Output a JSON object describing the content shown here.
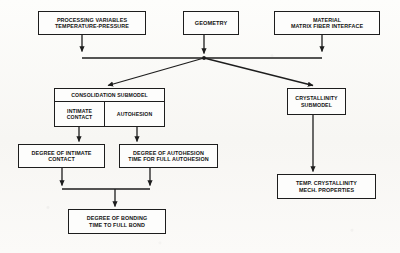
{
  "diagram": {
    "type": "flowchart",
    "stroke_color": "#1d1d1d",
    "background_color": "#fbfaf8",
    "nodes": {
      "processing": {
        "line1": "PROCESSING VARIABLES",
        "line2": "TEMPERATURE-PRESSURE"
      },
      "geometry": {
        "line1": "GEOMETRY"
      },
      "material": {
        "line1": "MATERIAL",
        "line2": "MATRIX FIBER INTERFACE"
      },
      "consolidation": {
        "header": "CONSOLIDATION SUBMODEL",
        "intimate_line1": "INTIMATE",
        "intimate_line2": "CONTACT",
        "autohesion_line1": "AUTOHESION"
      },
      "crystallinity": {
        "line1": "CRYSTALLINITY",
        "line2": "SUBMODEL"
      },
      "intimate_result": {
        "line1": "DEGREE OF INTIMATE",
        "line2": "CONTACT"
      },
      "autohesion_result": {
        "line1": "DEGREE OF AUTOHESION",
        "line2": "TIME FOR FULL AUTOHESION"
      },
      "temp_result": {
        "line1": "TEMP. CRYSTALLINITY",
        "line2": "MECH. PROPERTIES"
      },
      "bonding": {
        "line1": "DEGREE OF BONDING",
        "line2": "TIME TO FULL BOND"
      }
    },
    "edges": [
      {
        "from": "processing",
        "to": "input-bus",
        "style": "arrow-down"
      },
      {
        "from": "geometry",
        "to": "input-bus",
        "style": "arrow-down"
      },
      {
        "from": "material",
        "to": "input-bus",
        "style": "arrow-down"
      },
      {
        "from": "input-bus",
        "to": "consolidation",
        "style": "diagonal-arrow"
      },
      {
        "from": "input-bus",
        "to": "crystallinity",
        "style": "diagonal-arrow"
      },
      {
        "from": "consolidation.intimate",
        "to": "intimate_result",
        "style": "arrow-down"
      },
      {
        "from": "consolidation.autohesion",
        "to": "autohesion_result",
        "style": "arrow-down"
      },
      {
        "from": "crystallinity",
        "to": "temp_result",
        "style": "arrow-down"
      },
      {
        "from": "intimate_result",
        "to": "merge-bus",
        "style": "arrow-down"
      },
      {
        "from": "autohesion_result",
        "to": "merge-bus",
        "style": "arrow-down"
      },
      {
        "from": "merge-bus",
        "to": "bonding",
        "style": "arrow-down"
      }
    ]
  }
}
